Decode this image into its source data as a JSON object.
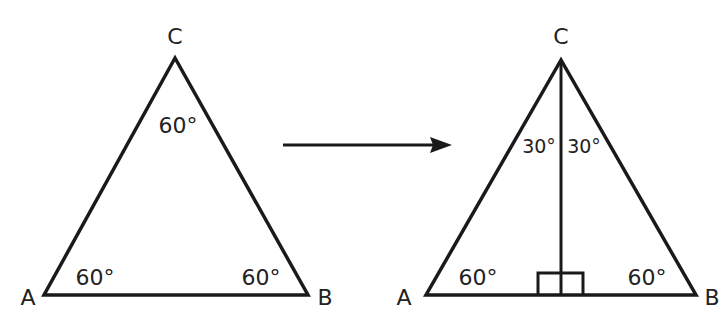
{
  "left_triangle": {
    "vertices": {
      "A": "A",
      "B": "B",
      "C": "C"
    },
    "angles": {
      "A": "60°",
      "B": "60°",
      "C": "60°"
    }
  },
  "arrow": {
    "direction": "right"
  },
  "right_triangle": {
    "vertices": {
      "A": "A",
      "B": "B",
      "C": "C"
    },
    "angles": {
      "A": "60°",
      "B": "60°",
      "C_left": "30°",
      "C_right": "30°"
    },
    "altitude": {
      "right_angle_marker": true
    }
  },
  "colors": {
    "stroke": "#1a1a1a",
    "background": "#ffffff"
  }
}
